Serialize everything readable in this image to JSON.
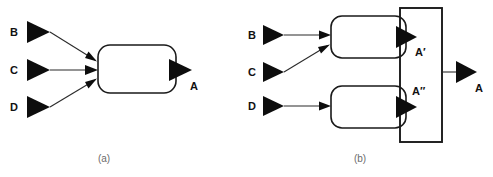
{
  "figure": {
    "background_color": "#ffffff",
    "stroke_color": "#1a1a1a",
    "marker_color": "#0d0d0d",
    "caption_color": "#6b6b6b"
  },
  "panel_a": {
    "caption": "(a)",
    "inputs": [
      {
        "label": "B",
        "marker": "filled-triangle-right"
      },
      {
        "label": "C",
        "marker": "filled-triangle-right"
      },
      {
        "label": "D",
        "marker": "filled-triangle-right"
      }
    ],
    "process": {
      "shape": "rounded-rectangle",
      "label": ""
    },
    "output": {
      "label": "A",
      "marker": "filled-triangle-right"
    }
  },
  "panel_b": {
    "caption": "(b)",
    "inputs": [
      {
        "label": "B",
        "marker": "filled-triangle-right"
      },
      {
        "label": "C",
        "marker": "filled-triangle-right"
      },
      {
        "label": "D",
        "marker": "filled-triangle-right"
      }
    ],
    "processes": [
      {
        "shape": "rounded-rectangle",
        "output_label": "A′",
        "marker": "filled-triangle-right"
      },
      {
        "shape": "rounded-rectangle",
        "output_label": "A″",
        "marker": "filled-triangle-right"
      }
    ],
    "grouping_box": {
      "shape": "rectangle",
      "label": ""
    },
    "output": {
      "label": "A",
      "marker": "filled-triangle-right"
    }
  }
}
